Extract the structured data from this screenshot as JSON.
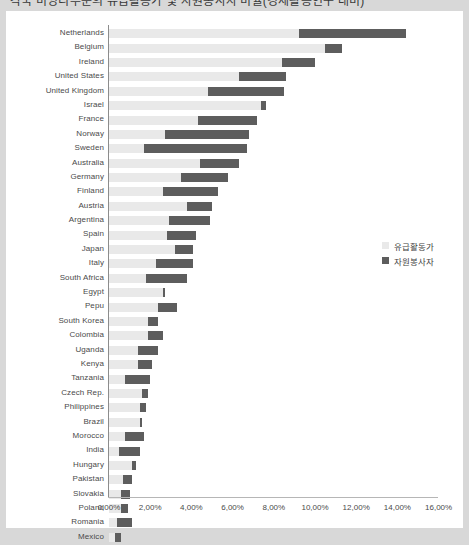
{
  "title": "각국 비영리부문의 유급활동가 및 자원봉사자 비율(경제활동인구 대비)",
  "legend": {
    "position": "right",
    "items": [
      {
        "label": "유급활동가",
        "color": "#e9e9e9",
        "key": "paid"
      },
      {
        "label": "자원봉사자",
        "color": "#5d5d5d",
        "key": "volunteer"
      }
    ]
  },
  "axis": {
    "x_ticks": [
      "0,00%",
      "2,00%",
      "4,00%",
      "6,00%",
      "8,00%",
      "10,00%",
      "12,00%",
      "14,00%",
      "16,00%"
    ],
    "x_tick_values": [
      0,
      2,
      4,
      6,
      8,
      10,
      12,
      14,
      16
    ]
  },
  "chart_data": {
    "type": "bar",
    "orientation": "horizontal",
    "stacked": true,
    "title": "각국 비영리부문의 유급활동가 및 자원봉사자 비율(경제활동인구 대비)",
    "xlabel": "",
    "ylabel": "",
    "xlim": [
      0,
      16
    ],
    "grid": false,
    "legend_position": "right",
    "categories": [
      "Netherlands",
      "Belgium",
      "Ireland",
      "United States",
      "United Kingdom",
      "Israel",
      "France",
      "Norway",
      "Sweden",
      "Australia",
      "Germany",
      "Finland",
      "Austria",
      "Argentina",
      "Spain",
      "Japan",
      "Italy",
      "South Africa",
      "Egypt",
      "Pepu",
      "South Korea",
      "Colombia",
      "Uganda",
      "Kenya",
      "Tanzania",
      "Czech Rep.",
      "Philippines",
      "Brazil",
      "Morocco",
      "India",
      "Hungary",
      "Pakistan",
      "Slovakia",
      "Poland",
      "Romania",
      "Mexico"
    ],
    "series": [
      {
        "name": "유급활동가",
        "color": "#e9e9e9",
        "values": [
          9.2,
          10.5,
          8.4,
          6.3,
          4.8,
          7.4,
          4.3,
          2.7,
          1.7,
          4.4,
          3.5,
          2.6,
          3.8,
          2.9,
          2.8,
          3.2,
          2.3,
          1.8,
          2.6,
          2.4,
          1.9,
          1.9,
          1.4,
          1.4,
          0.8,
          1.6,
          1.5,
          1.5,
          0.8,
          0.5,
          1.1,
          0.7,
          0.6,
          0.6,
          0.4,
          0.3
        ]
      },
      {
        "name": "자원봉사자",
        "color": "#5d5d5d",
        "values": [
          5.2,
          0.8,
          1.6,
          2.3,
          3.7,
          0.2,
          2.9,
          4.1,
          5.0,
          1.9,
          2.3,
          2.7,
          1.2,
          2.0,
          1.4,
          0.9,
          1.8,
          2.0,
          0.1,
          0.9,
          0.5,
          0.7,
          1.0,
          0.7,
          1.2,
          0.3,
          0.3,
          0.1,
          0.9,
          1.0,
          0.2,
          0.4,
          0.4,
          0.3,
          0.7,
          0.3
        ]
      }
    ]
  }
}
